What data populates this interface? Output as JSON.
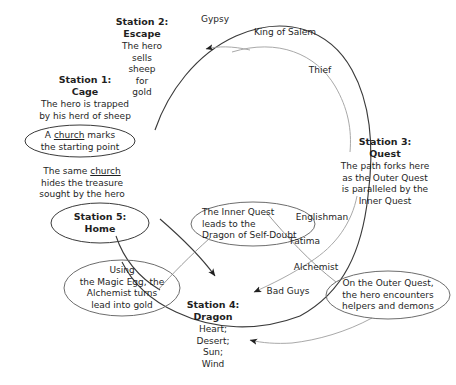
{
  "diagram": {
    "type": "circular-flow",
    "background_color": "#ffffff",
    "line_color": "#3a3a3a",
    "faint_line_color": "#a9a9a9",
    "text_color": "#1f1f1f"
  },
  "stations": [
    {
      "id": "station-1",
      "heading_line1": "Station 1:",
      "heading_line2": "Cage",
      "body": "The hero is trapped\nby his herd of sheep"
    },
    {
      "id": "station-2",
      "heading_line1": "Station 2:",
      "heading_line2": "Escape",
      "body": "The hero\nsells\nsheep\nfor\ngold"
    },
    {
      "id": "station-3",
      "heading_line1": "Station 3:",
      "heading_line2": "Quest",
      "body": "The path forks here\nas the Outer Quest\nis paralleled by the\nInner Quest"
    },
    {
      "id": "station-4",
      "heading_line1": "Station 4:",
      "heading_line2": "Dragon",
      "body": "Heart;\nDesert;\nSun;\nWind"
    },
    {
      "id": "station-5",
      "heading_line1": "Station 5:",
      "heading_line2": "Home",
      "body": ""
    }
  ],
  "arc_labels": [
    {
      "id": "gypsy",
      "text": "Gypsy"
    },
    {
      "id": "king-of-salem",
      "text": "King of Salem"
    },
    {
      "id": "thief",
      "text": "Thief"
    },
    {
      "id": "englishman",
      "text": "Englishman"
    },
    {
      "id": "fatima",
      "text": "Fatima"
    },
    {
      "id": "alchemist",
      "text": "Alchemist"
    },
    {
      "id": "bad-guys",
      "text": "Bad Guys"
    }
  ],
  "notes": [
    {
      "id": "church-start",
      "shape": "ellipse",
      "text_before": "A ",
      "text_underlined": "church",
      "text_after": " marks",
      "line2": "the starting point"
    },
    {
      "id": "inner-quest",
      "shape": "ellipse",
      "text": "The Inner Quest\nleads to the\nDragon of Self-Doubt"
    },
    {
      "id": "magic-egg",
      "shape": "ellipse",
      "text": "Using\nthe Magic Egg, the\nAlchemist turns\nlead into gold"
    },
    {
      "id": "outer-quest",
      "shape": "ellipse",
      "text": "On the Outer Quest,\nthe hero encounters\nhelpers and demons"
    }
  ],
  "plain_notes": [
    {
      "id": "church-treasure",
      "line1_before": "The same ",
      "line1_underlined": "church",
      "line2": "hides the treasure",
      "line3": "sought by the hero"
    }
  ]
}
